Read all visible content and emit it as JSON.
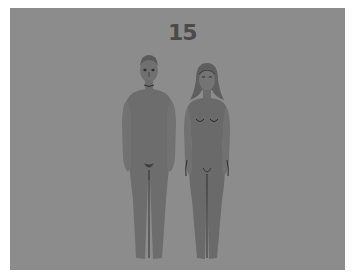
{
  "illustration": {
    "label": "15",
    "figures": [
      {
        "id": "male",
        "description": "standing male figure, front view"
      },
      {
        "id": "female",
        "description": "standing female figure, front view"
      }
    ],
    "colors": {
      "border": "#ffffff",
      "background": "#8c8c8c",
      "figure_fill": "#6f6f6f",
      "figure_shade": "#666666",
      "line": "#2e2e2e",
      "label": "#4a4a4a"
    }
  }
}
